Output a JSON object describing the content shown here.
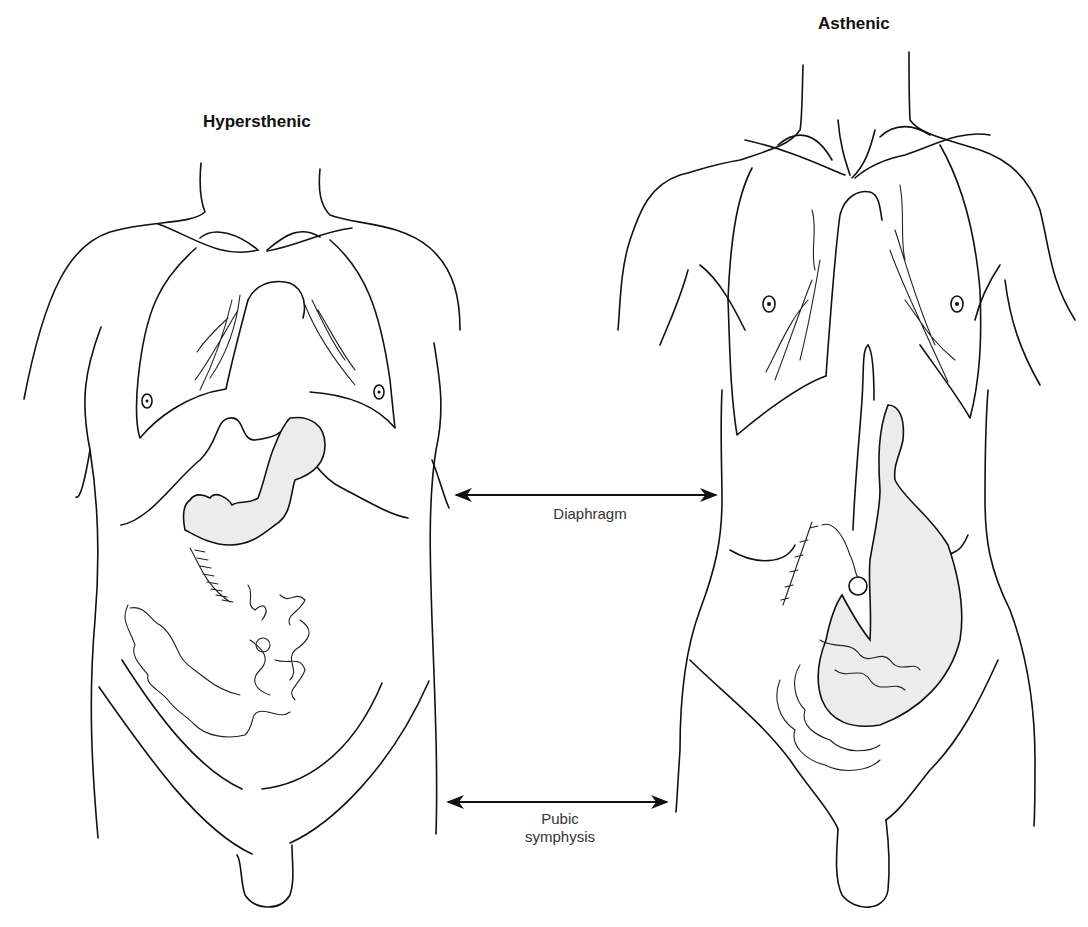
{
  "figure": {
    "left_body": {
      "title": "Hypersthenic"
    },
    "right_body": {
      "title": "Asthenic"
    },
    "labels": {
      "diaphragm": "Diaphragm",
      "pubic_line1": "Pubic",
      "pubic_line2": "symphysis"
    },
    "colors": {
      "line": "#111111",
      "organ_fill": "#ececec",
      "background": "#ffffff"
    }
  }
}
